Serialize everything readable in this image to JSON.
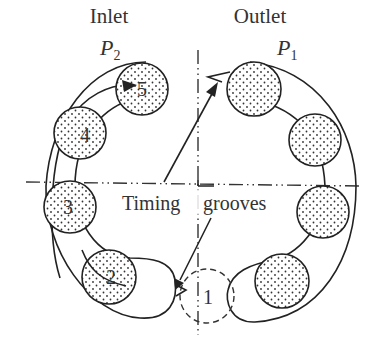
{
  "diagram": {
    "inlet": {
      "label": "Inlet",
      "pressure_symbol": "P",
      "pressure_subscript": "2"
    },
    "outlet": {
      "label": "Outlet",
      "pressure_symbol": "P",
      "pressure_subscript": "1"
    },
    "timing_label_left": "Timing",
    "timing_label_right": "grooves",
    "pocket_numbers": [
      "1",
      "2",
      "3",
      "4",
      "5"
    ],
    "colors": {
      "line": "#222222",
      "text": "#333333",
      "background": "#ffffff"
    }
  }
}
